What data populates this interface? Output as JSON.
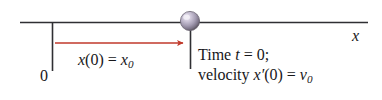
{
  "figure": {
    "type": "physics-kinematics-number-line",
    "background_color": "#ffffff",
    "axis": {
      "label": "x",
      "line_color": "#2a2a2a",
      "start_x": 20,
      "end_x": 368,
      "y": 22
    },
    "origin": {
      "label": "0",
      "tick_x": 52,
      "tick_top": 22,
      "tick_bottom": 71
    },
    "particle": {
      "name": "ball",
      "center_x": 190,
      "center_y": 21,
      "diameter": 20,
      "highlight_color": "#e8e4ef",
      "mid_color": "#9a93a8",
      "shadow_color": "#59525f",
      "tick_x": 190,
      "tick_top": 22,
      "tick_bottom": 69
    },
    "displacement_arrow": {
      "color": "#c0392b",
      "from_x": 55,
      "to_x": 189,
      "y": 43,
      "label_parts": {
        "var": "x",
        "open": "(0)",
        "equals": "=",
        "result_var": "x",
        "result_sub": "0"
      },
      "label_text": "x(0) = x0"
    },
    "annotations": {
      "time_line": {
        "prefix": "Time",
        "var": "t",
        "equals": "= 0;",
        "text": "Time t = 0;"
      },
      "velocity_line": {
        "prefix": "velocity",
        "var": "x",
        "prime": "′",
        "arg": "(0)",
        "equals": "=",
        "result_var": "v",
        "result_sub": "0",
        "text": "velocity x′(0) = v0"
      }
    }
  }
}
